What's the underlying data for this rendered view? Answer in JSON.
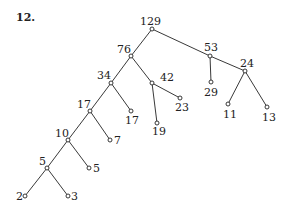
{
  "problem_number": "12.",
  "tree": {
    "nodes": [
      {
        "id": "n129",
        "label": "129",
        "x": 152,
        "y": 29,
        "lx": 140,
        "ly": 25,
        "anchor": "start"
      },
      {
        "id": "n76",
        "label": "76",
        "x": 131,
        "y": 56,
        "lx": 117,
        "ly": 53,
        "anchor": "start"
      },
      {
        "id": "n53",
        "label": "53",
        "x": 210,
        "y": 56,
        "lx": 204,
        "ly": 51,
        "anchor": "start"
      },
      {
        "id": "n24",
        "label": "24",
        "x": 245,
        "y": 71,
        "lx": 240,
        "ly": 67,
        "anchor": "start"
      },
      {
        "id": "n29",
        "label": "29",
        "x": 211,
        "y": 82,
        "lx": 204,
        "ly": 96,
        "anchor": "start"
      },
      {
        "id": "n42",
        "label": "42",
        "x": 152,
        "y": 83,
        "lx": 160,
        "ly": 81,
        "anchor": "start"
      },
      {
        "id": "n23",
        "label": "23",
        "x": 180,
        "y": 98,
        "lx": 175,
        "ly": 111,
        "anchor": "start"
      },
      {
        "id": "n34",
        "label": "34",
        "x": 111,
        "y": 83,
        "lx": 97,
        "ly": 79,
        "anchor": "start"
      },
      {
        "id": "n17b",
        "label": "17",
        "x": 131,
        "y": 111,
        "lx": 125,
        "ly": 124,
        "anchor": "start"
      },
      {
        "id": "n19",
        "label": "19",
        "x": 157,
        "y": 123,
        "lx": 152,
        "ly": 135,
        "anchor": "start"
      },
      {
        "id": "n11",
        "label": "11",
        "x": 228,
        "y": 104,
        "lx": 223,
        "ly": 118,
        "anchor": "start"
      },
      {
        "id": "n13",
        "label": "13",
        "x": 267,
        "y": 107,
        "lx": 262,
        "ly": 121,
        "anchor": "start"
      },
      {
        "id": "n17a",
        "label": "17",
        "x": 90,
        "y": 111,
        "lx": 77,
        "ly": 108,
        "anchor": "start"
      },
      {
        "id": "n7",
        "label": "7",
        "x": 110,
        "y": 140,
        "lx": 114,
        "ly": 144,
        "anchor": "start"
      },
      {
        "id": "n10",
        "label": "10",
        "x": 68,
        "y": 140,
        "lx": 55,
        "ly": 137,
        "anchor": "start"
      },
      {
        "id": "n5b",
        "label": "5",
        "x": 89,
        "y": 168,
        "lx": 93,
        "ly": 172,
        "anchor": "start"
      },
      {
        "id": "n5a",
        "label": "5",
        "x": 47,
        "y": 168,
        "lx": 39,
        "ly": 165,
        "anchor": "start"
      },
      {
        "id": "n2",
        "label": "2",
        "x": 25,
        "y": 196,
        "lx": 16,
        "ly": 200,
        "anchor": "start"
      },
      {
        "id": "n3",
        "label": "3",
        "x": 68,
        "y": 196,
        "lx": 71,
        "ly": 200,
        "anchor": "start"
      }
    ],
    "edges": [
      [
        "n129",
        "n76"
      ],
      [
        "n129",
        "n53"
      ],
      [
        "n53",
        "n29"
      ],
      [
        "n53",
        "n24"
      ],
      [
        "n24",
        "n11"
      ],
      [
        "n24",
        "n13"
      ],
      [
        "n76",
        "n34"
      ],
      [
        "n76",
        "n42"
      ],
      [
        "n42",
        "n19"
      ],
      [
        "n42",
        "n23"
      ],
      [
        "n34",
        "n17a"
      ],
      [
        "n34",
        "n17b"
      ],
      [
        "n17a",
        "n10"
      ],
      [
        "n17a",
        "n7"
      ],
      [
        "n10",
        "n5a"
      ],
      [
        "n10",
        "n5b"
      ],
      [
        "n5a",
        "n2"
      ],
      [
        "n5a",
        "n3"
      ]
    ]
  },
  "colors": {
    "line": "#222222",
    "node_fill": "#ffffff"
  }
}
